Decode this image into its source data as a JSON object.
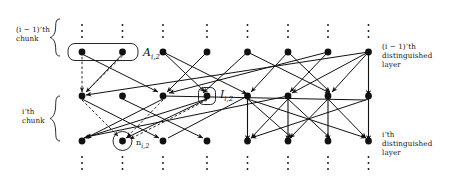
{
  "figure": {
    "type": "layered-graph-diagram",
    "background": "#ffffff",
    "ink": "#111111",
    "node_color": "#111111",
    "columns_x": [
      82,
      122.5,
      163,
      207,
      247.5,
      288,
      328,
      368.5
    ],
    "rows_y": [
      52,
      96,
      141
    ],
    "row_roles": [
      "(i-1)'th distinguished layer",
      "i'th chunk top",
      "i'th distinguished layer"
    ]
  },
  "labels": {
    "left_top_line1": "(i − 1)’th",
    "left_top_line2": "chunk",
    "left_bottom_line1": "i’th",
    "left_bottom_line2": "chunk",
    "right_top_line1": "(i − 1)’th",
    "right_top_line2": "distinguished",
    "right_top_line3": "layer",
    "right_bottom_line1": "i’th",
    "right_bottom_line2": "distinguished",
    "right_bottom_line3": "layer",
    "box_A_label_base": "A",
    "box_A_label_sub": "i,2",
    "box_I_label_base": "I",
    "box_I_label_sub": "i,2",
    "circle_n_label_base": "n",
    "circle_n_label_sub": "i,2"
  },
  "annotations": {
    "A_box": {
      "name": "A_{i,2}",
      "shape": "rounded-rect",
      "x": 68,
      "y": 44,
      "w": 70,
      "h": 17,
      "encloses_nodes": [
        0,
        1
      ],
      "row": 0
    },
    "I_box": {
      "name": "I_{i,2}",
      "shape": "rounded-rect",
      "x": 198,
      "y": 88,
      "w": 18,
      "h": 17,
      "encloses_nodes": [
        3
      ],
      "row": 1
    },
    "n_circle": {
      "name": "n_{i,2}",
      "shape": "circle",
      "cx": 122.5,
      "cy": 141,
      "r": 9.5,
      "encloses_nodes": [
        1
      ],
      "row": 2
    }
  },
  "vertical_dots": {
    "top_y": [
      25,
      31,
      37
    ],
    "bottom_y": [
      157,
      163,
      169
    ],
    "count_per_column": 3
  },
  "edges": {
    "solid_count": 28,
    "dashed_count": 5,
    "arrowheads": true,
    "note": "directed edges between layers"
  }
}
